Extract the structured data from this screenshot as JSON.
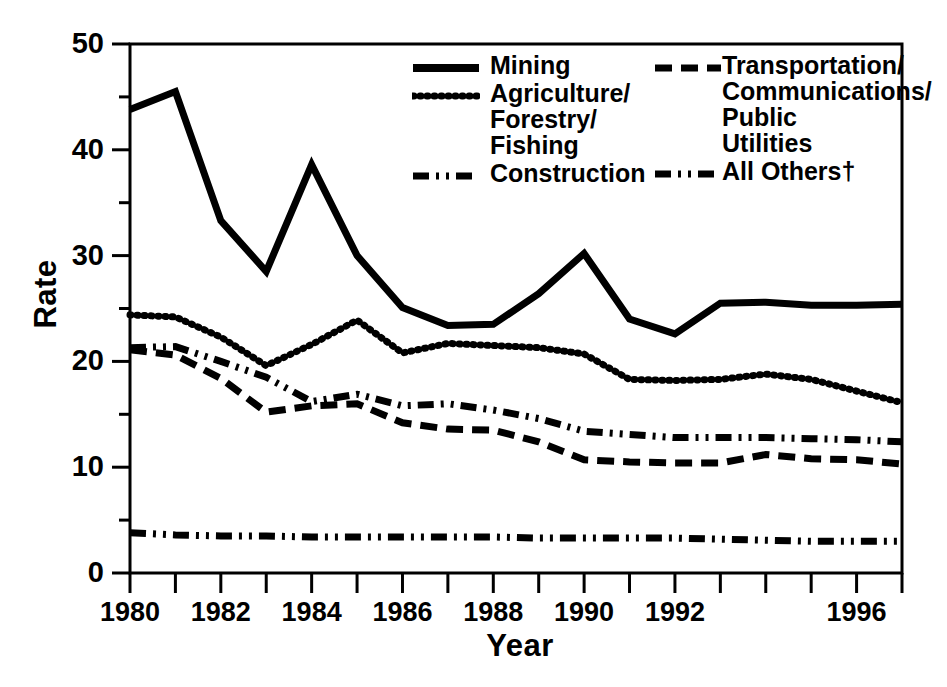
{
  "chart_data": {
    "type": "line",
    "title": "",
    "subtitle": "",
    "xlabel": "Year",
    "ylabel": "Rate",
    "xlim": [
      1980,
      1997
    ],
    "ylim": [
      0,
      50
    ],
    "grid": false,
    "legend_position": "top-right-inside",
    "y_ticks_major": [
      0,
      10,
      20,
      30,
      40,
      50
    ],
    "y_ticks_major_labels": [
      "0",
      "10",
      "20",
      "30",
      "40",
      "50"
    ],
    "y_ticks_minor": [
      5,
      15,
      25,
      35,
      45
    ],
    "x_ticks": [
      1980,
      1981,
      1982,
      1983,
      1984,
      1985,
      1986,
      1987,
      1988,
      1989,
      1990,
      1991,
      1992,
      1993,
      1994,
      1995,
      1996,
      1997
    ],
    "x_tick_labels_shown": [
      {
        "year": 1980,
        "label": "1980"
      },
      {
        "year": 1982,
        "label": "1982"
      },
      {
        "year": 1984,
        "label": "1984"
      },
      {
        "year": 1986,
        "label": "1986"
      },
      {
        "year": 1988,
        "label": "1988"
      },
      {
        "year": 1990,
        "label": "1990"
      },
      {
        "year": 1992,
        "label": "1992"
      },
      {
        "year": 1996,
        "label": "1996"
      }
    ],
    "x": [
      1980,
      1981,
      1982,
      1983,
      1984,
      1985,
      1986,
      1987,
      1988,
      1989,
      1990,
      1991,
      1992,
      1993,
      1994,
      1995,
      1996,
      1997
    ],
    "series": [
      {
        "name": "Mining",
        "style": "solid",
        "values": [
          43.8,
          45.5,
          33.3,
          28.5,
          38.6,
          30.0,
          25.1,
          23.4,
          23.5,
          26.4,
          30.2,
          24.0,
          22.6,
          25.5,
          25.6,
          25.3,
          25.3,
          25.4
        ]
      },
      {
        "name": "Agriculture/\nForestry/\nFishing",
        "style": "dotted-x",
        "values": [
          24.4,
          24.2,
          22.3,
          19.6,
          21.6,
          23.9,
          20.8,
          21.7,
          21.5,
          21.3,
          20.7,
          18.3,
          18.2,
          18.3,
          18.8,
          18.3,
          17.2,
          16.1
        ]
      },
      {
        "name": "Construction",
        "style": "dash-dot-dot",
        "values": [
          21.3,
          21.4,
          20.0,
          18.5,
          16.2,
          16.9,
          15.8,
          16.0,
          15.4,
          14.6,
          13.4,
          13.1,
          12.8,
          12.8,
          12.8,
          12.7,
          12.6,
          12.4
        ]
      },
      {
        "name": "Transportation/\nCommunications/\nPublic Utilities",
        "style": "dashed",
        "values": [
          21.1,
          20.6,
          18.4,
          15.2,
          15.8,
          16.0,
          14.2,
          13.6,
          13.5,
          12.4,
          10.7,
          10.5,
          10.4,
          10.4,
          11.2,
          10.8,
          10.7,
          10.3
        ]
      },
      {
        "name": "All Others†",
        "style": "dash-dot-dot",
        "values": [
          3.8,
          3.6,
          3.5,
          3.5,
          3.4,
          3.4,
          3.4,
          3.4,
          3.4,
          3.3,
          3.3,
          3.3,
          3.3,
          3.2,
          3.1,
          3.0,
          3.0,
          3.0
        ]
      }
    ],
    "footnote_marker": "†",
    "colors": {
      "ink": "#000000",
      "background": "#ffffff"
    }
  },
  "legend": {
    "left_column": [
      {
        "label": "Mining",
        "swatch": "solid-line-swatch"
      },
      {
        "label": "Agriculture/\nForestry/\nFishing",
        "swatch": "dotted-x-line-swatch"
      },
      {
        "label": "Construction",
        "swatch": "dash-dot-dot-line-swatch"
      }
    ],
    "right_column": [
      {
        "label": "Transportation/\nCommunications/\nPublic Utilities",
        "swatch": "dashed-line-swatch"
      },
      {
        "label": "All Others†",
        "swatch": "dash-dot-dot-line-swatch"
      }
    ]
  },
  "axes": {
    "x_title": "Year",
    "y_title": "Rate"
  }
}
